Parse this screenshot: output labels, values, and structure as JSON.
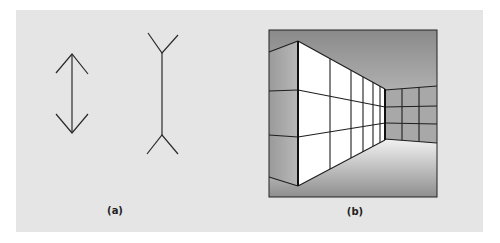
{
  "figure": {
    "panel_color": "#e5e5e5",
    "line_color": "#2a2a2a",
    "subfigures": [
      {
        "id": "a",
        "label": "(a)",
        "description": "Muller-Lyer illusion: arrow with inward-pointing heads and line with outward-pointing fins"
      },
      {
        "id": "b",
        "label": "(b)",
        "description": "Perspective room corner with tiled walls illustrating the Muller-Lyer effect in 3D"
      }
    ]
  }
}
